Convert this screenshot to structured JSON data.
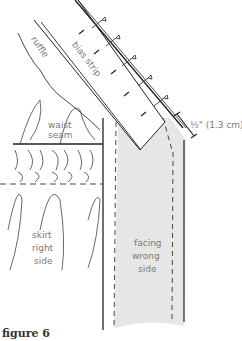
{
  "figure": {
    "caption": "figure 6",
    "labels": {
      "ruffle": "ruffle",
      "bias_strip": "bias strip",
      "waist_seam_1": "waist",
      "waist_seam_2": "seam",
      "measurement": "½\" (1.3 cm)",
      "skirt_1": "skirt",
      "skirt_2": "right",
      "skirt_3": "side",
      "facing_1": "facing",
      "facing_2": "wrong",
      "facing_3": "side"
    },
    "colors": {
      "line": "#222222",
      "label": "#7a7a7a",
      "facing_fill": "#e6e6e6"
    }
  }
}
